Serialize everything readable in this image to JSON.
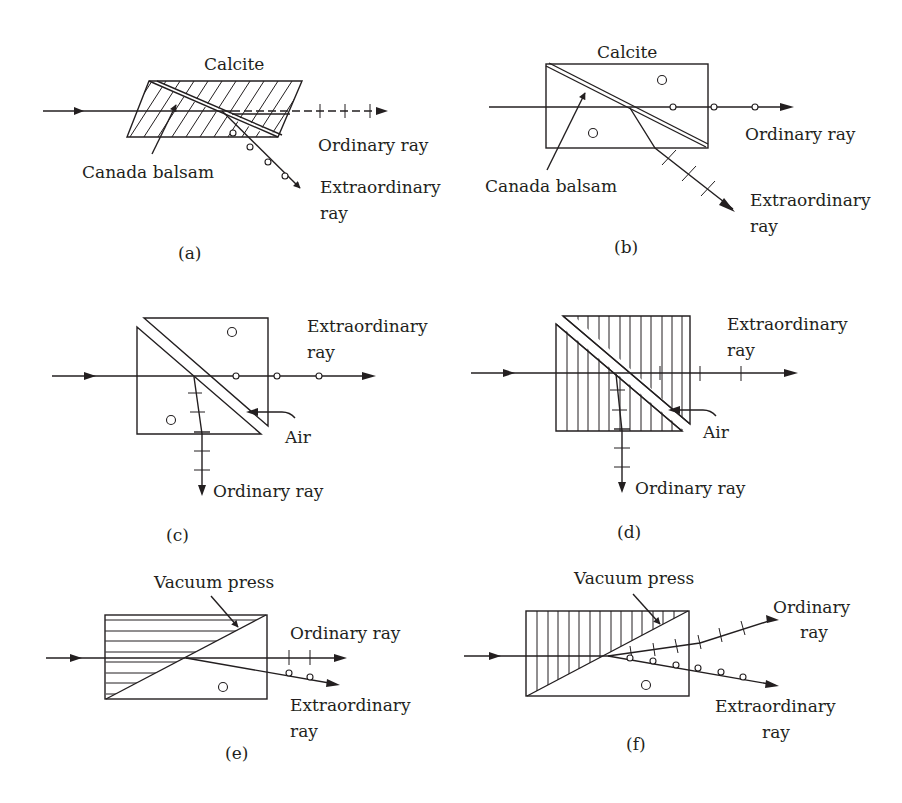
{
  "figure": {
    "panels": [
      {
        "id": "a",
        "caption": "(a)",
        "title": "Calcite",
        "labels": [
          "Canada balsam",
          "Ordinary ray",
          "Extraordinary",
          "ray"
        ],
        "hatch": "diagonal"
      },
      {
        "id": "b",
        "caption": "(b)",
        "title": "Calcite",
        "labels": [
          "Canada balsam",
          "Ordinary ray",
          "Extraordinary",
          "ray"
        ],
        "hatch": "none"
      },
      {
        "id": "c",
        "caption": "(c)",
        "labels": [
          "Extraordinary",
          "ray",
          "Air",
          "Ordinary ray"
        ],
        "hatch": "none"
      },
      {
        "id": "d",
        "caption": "(d)",
        "labels": [
          "Extraordinary",
          "ray",
          "Air",
          "Ordinary ray"
        ],
        "hatch": "vertical"
      },
      {
        "id": "e",
        "caption": "(e)",
        "labels": [
          "Vacuum press",
          "Ordinary ray",
          "Extraordinary",
          "ray"
        ],
        "hatch": "horizontal"
      },
      {
        "id": "f",
        "caption": "(f)",
        "labels": [
          "Vacuum press",
          "Ordinary",
          "ray",
          "Extraordinary",
          "ray"
        ],
        "hatch": "vertical"
      }
    ]
  }
}
